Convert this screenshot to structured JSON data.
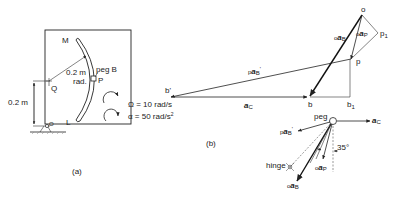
{
  "figure_a": {
    "caption": "(a)",
    "labels": {
      "M": "M",
      "L": "L",
      "P": "P",
      "Q": "Q",
      "O": "O",
      "peg": "peg B",
      "radius": "0.2 m",
      "radius_sub": "rad.",
      "height": "0.2 m"
    },
    "omega": "Ω = 10 rad/s",
    "alpha_prefix": "α = 50 rad/s",
    "alpha_exp": "2"
  },
  "figure_b": {
    "caption": "(b)",
    "points": {
      "o": "o",
      "p": "p",
      "p1": "p",
      "p1_sub": "1",
      "b": "b",
      "b1": "b",
      "b1_sub": "1",
      "bprime": "b'"
    },
    "vectors": {
      "oaB_pre": "o",
      "oaB_main": "a",
      "oaB_sub": "B",
      "oaP_pre": "o",
      "oaP_main": "a",
      "oaP_sub": "P",
      "paB_pre": "p",
      "paB_main": "a",
      "paB_sub": "B",
      "paB_prime": "'",
      "aC_main": "a",
      "aC_sub": "C"
    }
  },
  "figure_c": {
    "peg": "peg",
    "hinge": "hinge",
    "angle": "35°",
    "aC_main": "a",
    "aC_sub": "C",
    "paB_pre": "p",
    "paB_main": "a",
    "paB_sub": "B",
    "paB_prime": "'",
    "oaP_pre": "o",
    "oaP_main": "a",
    "oaP_sub": "P",
    "oaB_pre": "o",
    "oaB_main": "a",
    "oaB_sub": "B"
  }
}
